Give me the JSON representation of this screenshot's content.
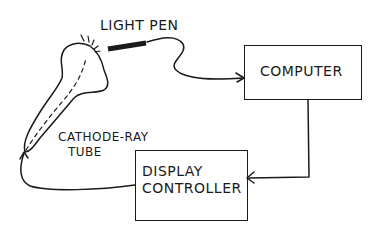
{
  "diagram": {
    "type": "block-diagram",
    "style": "hand-drawn line art",
    "nodes": [
      {
        "id": "light_pen",
        "label": "LIGHT PEN",
        "shape": "pen"
      },
      {
        "id": "crt",
        "label_line1": "CATHODE-RAY",
        "label_line2": "TUBE",
        "shape": "tube"
      },
      {
        "id": "computer",
        "label": "COMPUTER",
        "shape": "box"
      },
      {
        "id": "display_controller",
        "label_line1": "DISPLAY",
        "label_line2": "CONTROLLER",
        "shape": "box"
      }
    ],
    "edges": [
      {
        "from": "light_pen",
        "to": "computer",
        "arrow": true
      },
      {
        "from": "computer",
        "to": "display_controller",
        "arrow": true
      },
      {
        "from": "display_controller",
        "to": "crt",
        "arrow": true
      }
    ],
    "colors": {
      "ink": "#1a1a1a",
      "background": "#ffffff"
    }
  }
}
